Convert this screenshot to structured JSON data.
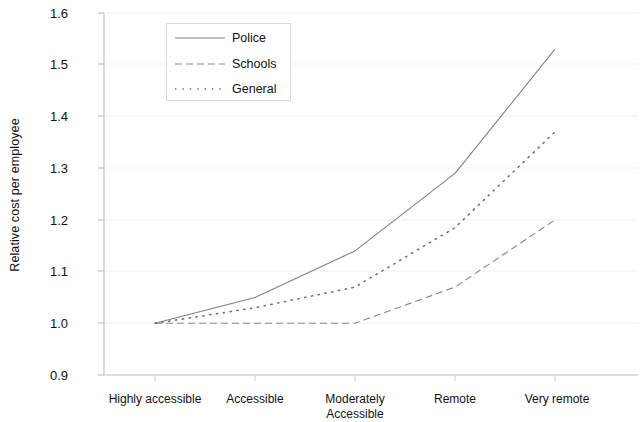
{
  "chart_data": {
    "type": "line",
    "title": "",
    "xlabel": "",
    "ylabel": "Relative cost  per employee",
    "categories": [
      "Highly accessible",
      "Accessible",
      "Moderately Accessible",
      "Remote",
      "Very remote"
    ],
    "category_lines": [
      [
        "Highly accessible"
      ],
      [
        "Accessible"
      ],
      [
        "Moderately",
        "Accessible"
      ],
      [
        "Remote"
      ],
      [
        "Very remote"
      ]
    ],
    "ylim": [
      0.9,
      1.6
    ],
    "yticks": [
      "1.6",
      "1.5",
      "1.4",
      "1.3",
      "1.2",
      "1.1",
      "1.0",
      "0.9"
    ],
    "ytick_values": [
      1.6,
      1.5,
      1.4,
      1.3,
      1.2,
      1.1,
      1.0,
      0.9
    ],
    "grid": true,
    "legend_position": "upper-left-inside",
    "series": [
      {
        "name": "Police",
        "style": "solid",
        "color": "#808080",
        "values": [
          1.0,
          1.05,
          1.14,
          1.29,
          1.53
        ]
      },
      {
        "name": "Schools",
        "style": "dashed",
        "color": "#8a8a8a",
        "values": [
          1.0,
          1.0,
          1.0,
          1.07,
          1.2
        ]
      },
      {
        "name": "General",
        "style": "dotted",
        "color": "#6e6e6e",
        "values": [
          1.0,
          1.03,
          1.07,
          1.185,
          1.37
        ]
      }
    ]
  },
  "axis": {
    "y_label": "Relative cost  per employee",
    "y_tick_1": "1.6",
    "y_tick_2": "1.5",
    "y_tick_3": "1.4",
    "y_tick_4": "1.3",
    "y_tick_5": "1.2",
    "y_tick_6": "1.1",
    "y_tick_7": "1.0",
    "y_tick_8": "0.9",
    "x_tick_1": "Highly accessible",
    "x_tick_2": "Accessible",
    "x_tick_3_line1": "Moderately",
    "x_tick_3_line2": "Accessible",
    "x_tick_4": "Remote",
    "x_tick_5": "Very remote"
  },
  "legend": {
    "items": [
      {
        "label": "Police"
      },
      {
        "label": "Schools"
      },
      {
        "label": "General"
      }
    ]
  },
  "colors": {
    "axis": "#b8b8b8",
    "grid": "#ededed",
    "police": "#808080",
    "schools": "#8a8a8a",
    "general": "#6e6e6e",
    "text": "#111111",
    "background": "#ffffff"
  }
}
